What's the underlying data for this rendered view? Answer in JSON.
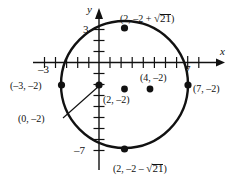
{
  "figure": {
    "kind": "coordinate-plane-circle",
    "axes": {
      "x_axis_label": "x",
      "y_axis_label": "y",
      "x_tick_labels": [
        {
          "text": "–3",
          "value": -3
        },
        {
          "text": "7",
          "value": 7
        }
      ],
      "y_tick_labels": [
        {
          "text": "3",
          "value": 3
        },
        {
          "text": "–7",
          "value": -7
        }
      ],
      "tick_spacing_units": 1,
      "x_range": [
        -5,
        9
      ],
      "y_range": [
        -9,
        5
      ],
      "grid": false
    },
    "circle": {
      "center": [
        2,
        -2
      ],
      "radius": 5,
      "center_label": "(2, –2)"
    },
    "points": [
      {
        "id": "left-vertex",
        "coords": [
          -3,
          -2
        ],
        "label": "(–3, –2)"
      },
      {
        "id": "right-vertex",
        "coords": [
          7,
          -2
        ],
        "label": "(7, –2)"
      },
      {
        "id": "y-intercept",
        "coords": [
          0,
          -2
        ],
        "label": "(0, –2)"
      },
      {
        "id": "center",
        "coords": [
          2,
          -2
        ],
        "label": "(2, –2)"
      },
      {
        "id": "interior",
        "coords": [
          4,
          -2
        ],
        "label": "(4, –2)"
      },
      {
        "id": "top-vertex",
        "coords": [
          2,
          2.58
        ],
        "label_parts": {
          "prefix": "(2, –2 + ",
          "radical": "21",
          "suffix": ")"
        }
      },
      {
        "id": "bottom-vertex",
        "coords": [
          2,
          -6.58
        ],
        "label_parts": {
          "prefix": "(2, –2 – ",
          "radical": "21",
          "suffix": ")"
        }
      }
    ],
    "labels": {
      "top_point": "(2, –2 + √21)",
      "bottom_point": "(2, –2 – √21)",
      "left_point": "(–3, –2)",
      "right_point": "(7, –2)",
      "y_intercept": "(0, –2)",
      "center_point": "(2, –2)",
      "interior_point": "(4, –2)",
      "x_axis": "x",
      "y_axis": "y",
      "x_neg3": "–3",
      "x_7": "7",
      "y_3": "3",
      "y_neg7": "–7"
    },
    "colors": {
      "stroke": "#111111",
      "background": "#ffffff"
    }
  }
}
